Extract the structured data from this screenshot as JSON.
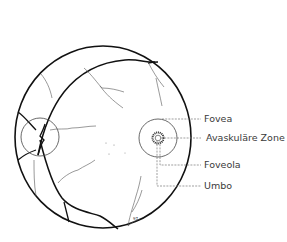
{
  "figure": {
    "labels": [
      {
        "id": "fovea",
        "text": "Fovea"
      },
      {
        "id": "avascular-zone",
        "text": "Avaskuläre Zone"
      },
      {
        "id": "foveola",
        "text": "Foveola"
      },
      {
        "id": "umbo",
        "text": "Umbo"
      }
    ],
    "corner_mark": "97"
  },
  "colors": {
    "outline": "#111111",
    "vessel": "#555555",
    "leader": "#777777",
    "text": "#3a3a3a"
  }
}
